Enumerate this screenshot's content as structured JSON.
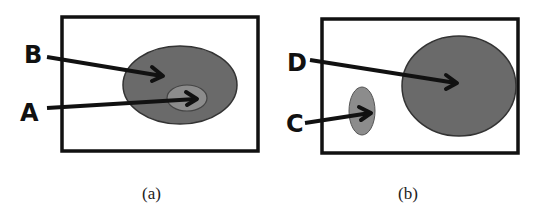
{
  "panels": [
    {
      "caption": "(a)",
      "labels": {
        "outer": "B",
        "inner": "A"
      },
      "description": "Small region A nested inside larger region B"
    },
    {
      "caption": "(b)",
      "labels": {
        "large": "D",
        "small": "C"
      },
      "description": "Small region C separate from larger region D"
    }
  ],
  "colors": {
    "dark_fill": "#6a6a6a",
    "light_fill": "#8c8c8c",
    "stroke": "#111111",
    "box": "#111111"
  }
}
